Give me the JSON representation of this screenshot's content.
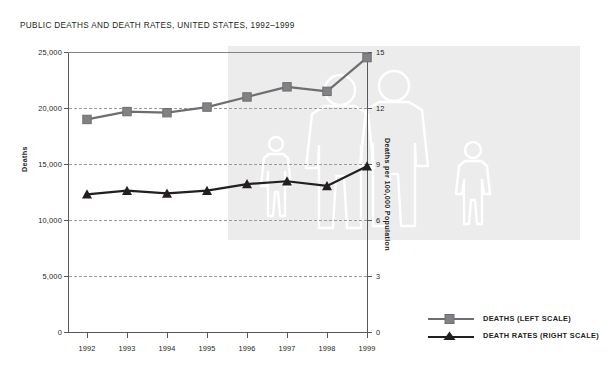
{
  "chart_data": {
    "type": "line",
    "title": "PUBLIC DEATHS AND DEATH RATES, UNITED STATES, 1992–1999",
    "categories": [
      "1992",
      "1993",
      "1994",
      "1995",
      "1996",
      "1997",
      "1998",
      "1999"
    ],
    "xlabel": "",
    "grid": true,
    "legend_position": "right-bottom",
    "series": [
      {
        "name": "DEATHS (LEFT SCALE)",
        "axis": "left",
        "marker": "square",
        "color": "#808285",
        "line_color": "#6d6e71",
        "values": [
          19000,
          19700,
          19600,
          20100,
          21000,
          21900,
          21500,
          24500
        ]
      },
      {
        "name": "DEATH RATES (RIGHT SCALE)",
        "axis": "right",
        "marker": "triangle",
        "color": "#231f20",
        "line_color": "#231f20",
        "values": [
          7.4,
          7.6,
          7.45,
          7.6,
          7.95,
          8.1,
          7.85,
          8.9
        ]
      }
    ],
    "left_axis": {
      "label": "Deaths",
      "ticks": [
        "0",
        "5,000",
        "10,000",
        "15,000",
        "20,000",
        "25,000"
      ],
      "tick_values": [
        0,
        5000,
        10000,
        15000,
        20000,
        25000
      ],
      "ylim": [
        0,
        25000
      ]
    },
    "right_axis": {
      "label": "Deaths per 100,000 Population",
      "ticks": [
        "0",
        "3",
        "6",
        "9",
        "12",
        "15"
      ],
      "tick_values": [
        0,
        3,
        6,
        9,
        12,
        15
      ],
      "ylim": [
        0,
        15
      ]
    }
  },
  "legend": {
    "items": [
      {
        "label": "DEATHS (LEFT SCALE)",
        "marker": "square-marker-icon"
      },
      {
        "label": "DEATH RATES (RIGHT SCALE)",
        "marker": "triangle-marker-icon"
      }
    ]
  },
  "watermark": {
    "name": "people-silhouettes-watermark",
    "band_color": "#ececec",
    "stroke_color": "#ffffff"
  }
}
